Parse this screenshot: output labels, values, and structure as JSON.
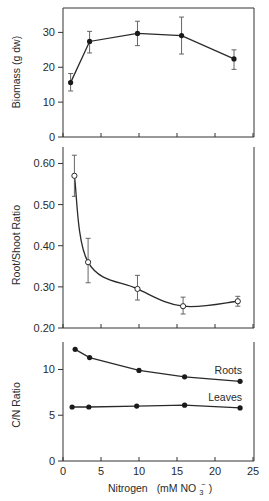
{
  "chart_data": [
    {
      "type": "line",
      "title": "",
      "xlabel": "",
      "ylabel": "Biomass (g dw)",
      "xlim": [
        0,
        25
      ],
      "ylim": [
        0,
        37
      ],
      "yticks": [
        0,
        10,
        20,
        30
      ],
      "grid": false,
      "marker": "filled-circle",
      "series": [
        {
          "name": "Biomass",
          "x": [
            1,
            3.5,
            9.8,
            15.6,
            22.5
          ],
          "values": [
            15.6,
            27.4,
            29.7,
            29.1,
            22.4
          ],
          "err_low": [
            13.2,
            24.1,
            26.2,
            23.8,
            19.4
          ],
          "err_high": [
            18.2,
            30.3,
            33.2,
            34.4,
            25.0
          ]
        }
      ]
    },
    {
      "type": "line",
      "title": "",
      "xlabel": "",
      "ylabel": "Root/Shoot Ratio",
      "xlim": [
        0,
        25
      ],
      "ylim": [
        0.2,
        0.64
      ],
      "yticks": [
        "0.20",
        "0.30",
        "0.40",
        "0.50",
        "0.60"
      ],
      "grid": false,
      "marker": "open-circle",
      "smooth": true,
      "series": [
        {
          "name": "Root/Shoot Ratio",
          "x": [
            1.5,
            3.3,
            9.8,
            15.8,
            23.0
          ],
          "values": [
            0.57,
            0.36,
            0.295,
            0.253,
            0.265
          ],
          "err_low": [
            0.52,
            0.31,
            0.268,
            0.234,
            0.253
          ],
          "err_high": [
            0.62,
            0.418,
            0.328,
            0.275,
            0.277
          ]
        }
      ]
    },
    {
      "type": "line",
      "title": "",
      "xlabel": "Nitrogen (mM NO3-)",
      "ylabel": "C/N Ratio",
      "xlim": [
        0,
        25
      ],
      "ylim": [
        0,
        13
      ],
      "xticks": [
        0,
        5,
        10,
        15,
        20,
        25
      ],
      "yticks": [
        0,
        5,
        10
      ],
      "grid": false,
      "marker": "filled-circle",
      "series": [
        {
          "name": "Roots",
          "x": [
            1.6,
            3.5,
            10.0,
            16.0,
            23.3
          ],
          "values": [
            12.2,
            11.3,
            9.9,
            9.2,
            8.7
          ]
        },
        {
          "name": "Leaves",
          "x": [
            1.2,
            3.4,
            9.7,
            16.0,
            23.3
          ],
          "values": [
            5.9,
            5.9,
            6.0,
            6.1,
            5.8
          ]
        }
      ]
    }
  ],
  "labels": {
    "panel1_ylabel": "Biomass (g dw)",
    "panel2_ylabel": "Root/Shoot Ratio",
    "panel3_ylabel": "C/N Ratio",
    "xlabel_main": "Nitrogen",
    "xlabel_unit_prefix": "(mM NO",
    "xlabel_sub": "3",
    "xlabel_sup": "−",
    "xlabel_close": ")",
    "roots_label": "Roots",
    "leaves_label": "Leaves"
  },
  "colors": {
    "line": "#2a2a2a",
    "axis": "#333333",
    "errorbar": "#555555",
    "background": "#ffffff"
  }
}
